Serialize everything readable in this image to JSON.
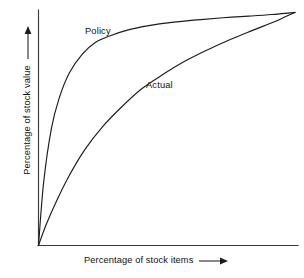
{
  "chart_data": {
    "type": "line",
    "title": "",
    "subtitle": "",
    "xlabel": "Percentage of stock items",
    "ylabel": "Percentage of stock value",
    "xlim": [
      0,
      100
    ],
    "ylim": [
      0,
      100
    ],
    "grid": false,
    "legend_position": "inline-annotation",
    "axis_arrows": true,
    "annotations": [
      {
        "text": "Policy",
        "x": 20,
        "y": 86
      },
      {
        "text": "Actual",
        "x": 44,
        "y": 70
      }
    ],
    "series": [
      {
        "name": "Policy",
        "label": "Policy",
        "color": "#1c1c1c",
        "x": [
          0,
          2,
          5,
          8,
          12,
          17,
          22,
          28,
          35,
          43,
          52,
          62,
          72,
          82,
          91,
          100
        ],
        "values": [
          0,
          27,
          50,
          63,
          74,
          82,
          87,
          90,
          92.5,
          94.3,
          95.7,
          96.8,
          97.7,
          98.4,
          99.1,
          100
        ]
      },
      {
        "name": "Actual",
        "label": "Actual",
        "color": "#1c1c1c",
        "x": [
          0,
          3,
          7,
          12,
          18,
          25,
          32,
          40,
          48,
          57,
          66,
          75,
          84,
          92,
          96,
          100
        ],
        "values": [
          0,
          9,
          19,
          30,
          41,
          51,
          59,
          67,
          73,
          79,
          84,
          88.5,
          92.5,
          96,
          98,
          100
        ]
      }
    ]
  },
  "labels": {
    "policy": "Policy",
    "actual": "Actual",
    "x_axis": "Percentage of stock items",
    "y_axis": "Percentage of stock value"
  },
  "icons": {
    "x_axis_arrow": "arrow-right-icon",
    "y_axis_arrow": "arrow-up-icon"
  },
  "colors": {
    "curve": "#1c1c1c",
    "axis": "#3a3a3a",
    "background": "#ffffff",
    "text": "#111111"
  }
}
